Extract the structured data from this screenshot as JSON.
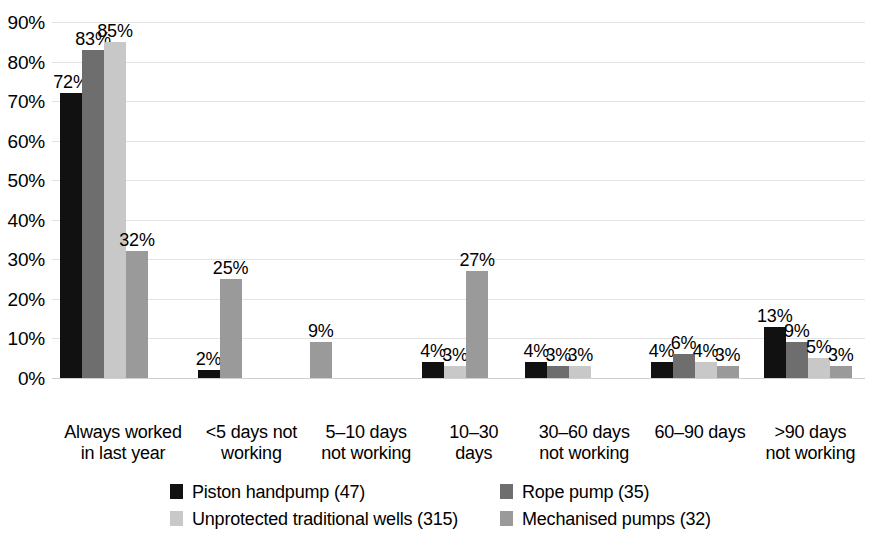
{
  "chart_data": {
    "type": "bar",
    "title": "",
    "subtitle": "",
    "xlabel": "",
    "ylabel": "",
    "ylim": [
      0,
      90
    ],
    "ytick_values": [
      0,
      10,
      20,
      30,
      40,
      50,
      60,
      70,
      80,
      90
    ],
    "ytick_labels": [
      "0%",
      "10%",
      "20%",
      "30%",
      "40%",
      "50%",
      "60%",
      "70%",
      "80%",
      "90%"
    ],
    "grid": true,
    "legend_position": "bottom",
    "data_labels": true,
    "categories": [
      "Always worked in last year",
      "<5 days not working",
      "5–10 days not working",
      "10–30 days",
      "30–60 days not working",
      "60–90 days",
      ">90 days not working"
    ],
    "category_lines": [
      [
        "Always worked",
        "in last year"
      ],
      [
        "<5 days not",
        "working"
      ],
      [
        "5–10 days",
        "not working"
      ],
      [
        "10–30",
        "days"
      ],
      [
        "30–60 days",
        "not working"
      ],
      [
        "60–90 days",
        ""
      ],
      [
        ">90 days",
        "not working"
      ]
    ],
    "series": [
      {
        "name": "Piston handpump (47)",
        "color": "#111111",
        "values": [
          72,
          2,
          null,
          4,
          4,
          4,
          13
        ],
        "labels": [
          "72%",
          "2%",
          "",
          "4%",
          "4%",
          "4%",
          "13%"
        ]
      },
      {
        "name": "Rope pump (35)",
        "color": "#6e6e6e",
        "values": [
          83,
          null,
          null,
          null,
          3,
          6,
          9
        ],
        "labels": [
          "83%",
          "",
          "",
          "",
          "3%",
          "6%",
          "9%"
        ]
      },
      {
        "name": "Unprotected traditional wells (315)",
        "color": "#c8c8c8",
        "values": [
          85,
          null,
          null,
          3,
          3,
          4,
          5
        ],
        "labels": [
          "85%",
          "",
          "",
          "3%",
          "3%",
          "4%",
          "5%"
        ]
      },
      {
        "name": "Mechanised pumps (32)",
        "color": "#9a9a9a",
        "values": [
          32,
          25,
          9,
          27,
          null,
          3,
          3
        ],
        "labels": [
          "32%",
          "25%",
          "9%",
          "27%",
          "",
          "3%",
          "3%"
        ]
      }
    ]
  },
  "legend": {
    "items": [
      {
        "label": "Piston handpump (47)",
        "color": "#111111"
      },
      {
        "label": "Rope pump (35)",
        "color": "#6e6e6e"
      },
      {
        "label": "Unprotected traditional wells (315)",
        "color": "#c8c8c8"
      },
      {
        "label": "Mechanised pumps (32)",
        "color": "#9a9a9a"
      }
    ]
  }
}
